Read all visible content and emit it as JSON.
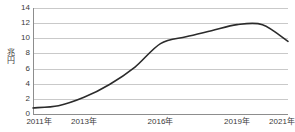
{
  "chart_data": {
    "type": "line",
    "title": "",
    "xlabel": "",
    "ylabel": "兆円",
    "ylim": [
      0,
      14
    ],
    "yticks": [
      0,
      2,
      4,
      6,
      8,
      10,
      12,
      14
    ],
    "ytick_labels": [
      "0",
      "2",
      "4",
      "6",
      "8",
      "10",
      "12",
      "14"
    ],
    "grid": true,
    "legend": "none",
    "x": [
      2011,
      2012,
      2013,
      2014,
      2015,
      2016,
      2017,
      2018,
      2019,
      2020,
      2021
    ],
    "xtick_labels": [
      "2011年",
      "2013年",
      "2016年",
      "2019年",
      "2021年"
    ],
    "xtick_values": [
      2011,
      2013,
      2016,
      2019,
      2021
    ],
    "series": [
      {
        "name": "金額",
        "values": [
          0.8,
          1.1,
          2.2,
          3.9,
          6.2,
          9.3,
          10.2,
          11.0,
          11.8,
          11.8,
          9.6
        ],
        "color": "#2b2b2b"
      }
    ],
    "colors": {
      "line": "#2b2b2b",
      "grid": "#c9c9c9",
      "axis": "#8d8d8d",
      "text": "#3a3a3a",
      "background": "#ffffff"
    }
  }
}
